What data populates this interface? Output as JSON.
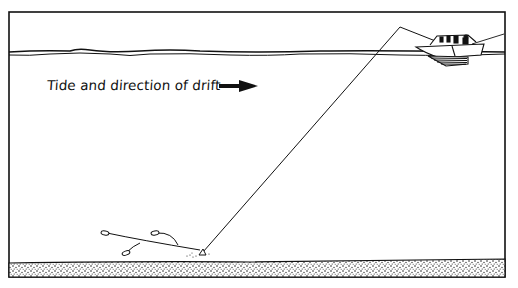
{
  "diagram": {
    "caption": "Tide and direction of drift",
    "elements": {
      "arrow": "right-arrow-icon",
      "boat": "boat-icon",
      "fishing_line": "line from boat rod down to seabed sinker",
      "rig": "spreader with three baited hooks",
      "seabed": "stippled sand bottom",
      "surface": "wavy water surface line"
    },
    "colors": {
      "ink": "#111111",
      "background": "#ffffff"
    }
  }
}
